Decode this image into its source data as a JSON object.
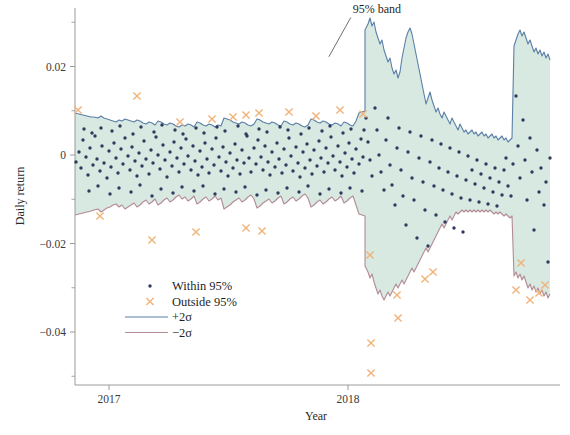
{
  "chart_data": {
    "type": "scatter",
    "title": "",
    "xlabel": "Year",
    "ylabel": "Daily return",
    "xlim": [
      2016.86,
      2018.78
    ],
    "ylim": [
      -0.0505,
      0.0345
    ],
    "grid": false,
    "x_ticks": [
      {
        "value": 2017,
        "label": "2017"
      },
      {
        "value": 2018,
        "label": "2018"
      }
    ],
    "y_ticks": [
      {
        "value": 0.02,
        "label": "0.02"
      },
      {
        "value": 0,
        "label": "0"
      },
      {
        "value": -0.02,
        "label": "−0.02"
      },
      {
        "value": -0.04,
        "label": "−0.04"
      }
    ],
    "y_minor_ticks": [
      0.03,
      0.01,
      -0.01,
      -0.03,
      -0.05
    ],
    "annotations": [
      {
        "text": "95% band",
        "text_x": 2018.02,
        "text_y": 0.0322,
        "leader_to_x": 2017.92,
        "leader_to_y": 0.0222
      }
    ],
    "legend": {
      "position": "lower-left-inside",
      "entries": [
        {
          "label": "Within 95%",
          "marker": "dot",
          "color": "#2e3b5e"
        },
        {
          "label": "Outside 95%",
          "marker": "cross",
          "color": "#f0b37a"
        },
        {
          "label": "+2σ",
          "marker": "line",
          "color": "#5a7fa8"
        },
        {
          "label": "−2σ",
          "marker": "line",
          "color": "#b38a96"
        }
      ]
    },
    "colors": {
      "band_fill": "#d7e9e1",
      "upper_line": "#5a7fa8",
      "lower_line": "#b38a96",
      "within_marker": "#2e3b5e",
      "outside_marker": "#f0b37a",
      "axis": "#9a9a9a",
      "text": "#1f1f1f"
    },
    "series": [
      {
        "name": "+2σ",
        "type": "line",
        "color": "#5a7fa8",
        "points_px": "75,113 79,114 83,115 87,116 91,117 94,117 98,118 101,116 104,118 107,119 110,120 113,121 116,122 119,120 122,121 125,119 128,120 131,121 134,122 137,120 140,121 143,123 146,124 149,122 152,123 155,125 158,121 161,122 164,124 167,125 170,123 173,124 176,126 179,127 182,125 185,126 188,124 191,125 194,127 197,122 200,123 203,125 206,126 209,124 212,125 215,127 218,125 221,126 224,118 227,119 230,120 233,122 236,123 239,124 242,122 245,123 248,125 251,126 254,124 257,119 260,120 263,122 266,123 269,124 272,122 275,123 278,125 281,126 284,121 287,122 290,124 293,125 296,123 299,124 302,126 305,127 308,125 311,119 314,120 317,122 320,123 323,121 326,122 329,124 332,125 335,123 338,124 341,126 344,122 347,123 350,125 353,126 356,121 359,113 362,112 365,111 365,30 368,24 370,18 372,26 374,22 376,32 378,38 380,44 382,40 384,50 386,56 388,62 390,58 392,68 394,74 396,70 398,78 400,72 402,58 404,48 406,38 408,32 410,28 412,34 414,44 416,54 418,64 420,74 422,84 424,94 426,104 428,98 430,92 432,100 434,106 436,112 438,108 440,114 442,118 444,112 446,116 448,120 450,124 452,118 454,122 456,126 458,130 460,124 462,128 464,132 466,130 468,134 470,132 472,130 474,134 476,132 478,136 480,134 482,132 484,136 486,134 488,138 490,136 492,134 494,138 496,136 498,140 500,138 502,136 504,140 506,138 508,142 510,140 512,138 514,46 516,40 518,34 520,30 522,36 524,32 526,38 528,44 530,40 532,46 534,52 536,48 538,54 540,50 542,56 544,52 546,58 548,54 550,60"
      },
      {
        "name": "−2σ",
        "type": "line",
        "color": "#b38a96",
        "points_px": "75,215 79,214 83,213 87,212 91,211 94,210 98,209 101,212 104,210 107,208 110,207 113,205 116,204 119,207 122,205 125,209 128,207 131,205 134,203 137,207 140,205 143,202 146,200 149,204 152,202 155,199 158,205 161,203 164,200 167,198 170,202 173,200 176,197 179,195 182,199 185,197 188,201 191,199 194,196 197,204 200,202 203,199 206,197 209,201 212,199 215,196 218,200 221,198 224,209 227,207 230,205 233,202 236,200 239,198 242,202 245,200 248,197 251,195 254,199 257,208 260,206 263,203 266,201 269,199 272,203 275,201 278,198 281,196 284,204 287,202 290,199 293,197 296,201 299,199 302,196 305,194 308,198 311,207 314,205 317,202 320,200 323,204 326,202 329,199 332,197 335,201 338,199 341,196 344,203 347,201 350,198 353,196 356,205 359,214 362,215 365,216 365,266 368,272 370,278 372,274 374,282 376,288 378,294 380,290 382,296 384,300 386,296 388,292 390,296 392,292 394,288 396,284 398,288 400,284 402,280 404,284 406,280 408,276 410,272 412,268 414,272 416,268 418,264 420,260 422,256 424,252 426,248 428,252 430,248 432,244 434,240 436,236 438,232 440,228 442,224 444,228 446,224 448,220 450,216 452,220 454,216 456,212 458,214 460,212 462,210 464,212 466,210 468,212 470,210 472,212 474,210 476,212 478,210 480,212 482,210 484,212 486,210 488,212 490,210 492,212 494,214 496,212 498,214 500,212 502,214 504,216 506,214 508,216 510,218 512,216 514,276 516,272 518,278 520,274 522,280 524,276 526,282 528,288 530,284 532,290 534,286 536,292 538,288 540,294 542,290 544,296 546,292 548,298 550,294"
      }
    ],
    "within_points_px": [
      [
        76,
        162
      ],
      [
        79,
        152
      ],
      [
        81,
        168
      ],
      [
        83,
        140
      ],
      [
        86,
        157
      ],
      [
        88,
        175
      ],
      [
        90,
        148
      ],
      [
        93,
        165
      ],
      [
        95,
        136
      ],
      [
        97,
        159
      ],
      [
        100,
        171
      ],
      [
        102,
        146
      ],
      [
        104,
        163
      ],
      [
        107,
        178
      ],
      [
        109,
        151
      ],
      [
        111,
        167
      ],
      [
        114,
        143
      ],
      [
        116,
        158
      ],
      [
        118,
        173
      ],
      [
        121,
        149
      ],
      [
        123,
        164
      ],
      [
        125,
        138
      ],
      [
        128,
        156
      ],
      [
        130,
        170
      ],
      [
        132,
        147
      ],
      [
        135,
        161
      ],
      [
        137,
        176
      ],
      [
        139,
        153
      ],
      [
        142,
        166
      ],
      [
        144,
        141
      ],
      [
        146,
        159
      ],
      [
        149,
        174
      ],
      [
        151,
        150
      ],
      [
        153,
        163
      ],
      [
        156,
        137
      ],
      [
        158,
        155
      ],
      [
        160,
        169
      ],
      [
        163,
        145
      ],
      [
        165,
        160
      ],
      [
        167,
        177
      ],
      [
        170,
        152
      ],
      [
        172,
        166
      ],
      [
        174,
        142
      ],
      [
        177,
        158
      ],
      [
        179,
        172
      ],
      [
        181,
        148
      ],
      [
        184,
        164
      ],
      [
        186,
        139
      ],
      [
        188,
        156
      ],
      [
        191,
        170
      ],
      [
        193,
        146
      ],
      [
        195,
        161
      ],
      [
        198,
        175
      ],
      [
        200,
        151
      ],
      [
        202,
        167
      ],
      [
        205,
        143
      ],
      [
        207,
        159
      ],
      [
        209,
        173
      ],
      [
        212,
        149
      ],
      [
        214,
        165
      ],
      [
        216,
        138
      ],
      [
        219,
        157
      ],
      [
        221,
        171
      ],
      [
        223,
        147
      ],
      [
        226,
        162
      ],
      [
        228,
        176
      ],
      [
        230,
        153
      ],
      [
        233,
        168
      ],
      [
        235,
        144
      ],
      [
        237,
        160
      ],
      [
        240,
        174
      ],
      [
        242,
        150
      ],
      [
        244,
        163
      ],
      [
        247,
        136
      ],
      [
        249,
        158
      ],
      [
        251,
        172
      ],
      [
        254,
        148
      ],
      [
        256,
        164
      ],
      [
        258,
        140
      ],
      [
        261,
        157
      ],
      [
        263,
        170
      ],
      [
        265,
        146
      ],
      [
        268,
        162
      ],
      [
        270,
        175
      ],
      [
        272,
        152
      ],
      [
        275,
        167
      ],
      [
        277,
        143
      ],
      [
        279,
        159
      ],
      [
        282,
        173
      ],
      [
        284,
        149
      ],
      [
        286,
        165
      ],
      [
        289,
        138
      ],
      [
        291,
        156
      ],
      [
        293,
        171
      ],
      [
        296,
        147
      ],
      [
        298,
        163
      ],
      [
        300,
        177
      ],
      [
        303,
        152
      ],
      [
        305,
        168
      ],
      [
        307,
        144
      ],
      [
        310,
        160
      ],
      [
        312,
        174
      ],
      [
        314,
        150
      ],
      [
        317,
        166
      ],
      [
        319,
        141
      ],
      [
        321,
        158
      ],
      [
        324,
        172
      ],
      [
        326,
        148
      ],
      [
        328,
        163
      ],
      [
        331,
        137
      ],
      [
        333,
        156
      ],
      [
        335,
        170
      ],
      [
        338,
        146
      ],
      [
        340,
        162
      ],
      [
        342,
        176
      ],
      [
        345,
        153
      ],
      [
        347,
        167
      ],
      [
        349,
        143
      ],
      [
        352,
        159
      ],
      [
        354,
        173
      ],
      [
        356,
        149
      ],
      [
        359,
        164
      ],
      [
        361,
        139
      ],
      [
        363,
        157
      ],
      [
        366,
        118
      ],
      [
        368,
        142
      ],
      [
        370,
        160
      ],
      [
        372,
        176
      ],
      [
        375,
        108
      ],
      [
        377,
        130
      ],
      [
        379,
        155
      ],
      [
        381,
        172
      ],
      [
        384,
        190
      ],
      [
        386,
        140
      ],
      [
        388,
        118
      ],
      [
        390,
        165
      ],
      [
        392,
        185
      ],
      [
        395,
        205
      ],
      [
        397,
        148
      ],
      [
        399,
        128
      ],
      [
        401,
        170
      ],
      [
        403,
        196
      ],
      [
        406,
        225
      ],
      [
        408,
        152
      ],
      [
        410,
        132
      ],
      [
        412,
        178
      ],
      [
        414,
        200
      ],
      [
        417,
        238
      ],
      [
        419,
        158
      ],
      [
        421,
        136
      ],
      [
        423,
        182
      ],
      [
        425,
        210
      ],
      [
        428,
        246
      ],
      [
        430,
        162
      ],
      [
        432,
        140
      ],
      [
        434,
        186
      ],
      [
        436,
        215
      ],
      [
        439,
        168
      ],
      [
        441,
        144
      ],
      [
        443,
        190
      ],
      [
        445,
        222
      ],
      [
        448,
        172
      ],
      [
        450,
        148
      ],
      [
        452,
        194
      ],
      [
        454,
        228
      ],
      [
        457,
        176
      ],
      [
        459,
        152
      ],
      [
        461,
        198
      ],
      [
        463,
        232
      ],
      [
        466,
        180
      ],
      [
        468,
        156
      ],
      [
        470,
        200
      ],
      [
        472,
        170
      ],
      [
        475,
        184
      ],
      [
        477,
        160
      ],
      [
        479,
        202
      ],
      [
        481,
        174
      ],
      [
        484,
        188
      ],
      [
        486,
        164
      ],
      [
        488,
        204
      ],
      [
        490,
        178
      ],
      [
        493,
        192
      ],
      [
        495,
        168
      ],
      [
        497,
        206
      ],
      [
        499,
        182
      ],
      [
        502,
        195
      ],
      [
        504,
        170
      ],
      [
        506,
        158
      ],
      [
        508,
        186
      ],
      [
        511,
        196
      ],
      [
        513,
        164
      ],
      [
        516,
        96
      ],
      [
        518,
        146
      ],
      [
        520,
        178
      ],
      [
        523,
        120
      ],
      [
        525,
        160
      ],
      [
        527,
        200
      ],
      [
        530,
        138
      ],
      [
        532,
        172
      ],
      [
        534,
        230
      ],
      [
        537,
        150
      ],
      [
        539,
        192
      ],
      [
        541,
        168
      ],
      [
        544,
        205
      ],
      [
        546,
        182
      ],
      [
        548,
        262
      ],
      [
        550,
        158
      ],
      [
        84,
        129
      ],
      [
        92,
        133
      ],
      [
        101,
        128
      ],
      [
        112,
        131
      ],
      [
        120,
        126
      ],
      [
        133,
        134
      ],
      [
        141,
        127
      ],
      [
        154,
        132
      ],
      [
        162,
        125
      ],
      [
        175,
        130
      ],
      [
        183,
        134
      ],
      [
        196,
        128
      ],
      [
        204,
        133
      ],
      [
        217,
        127
      ],
      [
        225,
        131
      ],
      [
        238,
        126
      ],
      [
        246,
        134
      ],
      [
        259,
        129
      ],
      [
        267,
        132
      ],
      [
        280,
        127
      ],
      [
        288,
        130
      ],
      [
        301,
        134
      ],
      [
        309,
        128
      ],
      [
        322,
        131
      ],
      [
        330,
        126
      ],
      [
        343,
        133
      ],
      [
        351,
        129
      ],
      [
        364,
        130
      ],
      [
        89,
        191
      ],
      [
        98,
        186
      ],
      [
        110,
        194
      ],
      [
        119,
        188
      ],
      [
        131,
        192
      ],
      [
        140,
        185
      ],
      [
        152,
        196
      ],
      [
        161,
        189
      ],
      [
        173,
        193
      ],
      [
        182,
        187
      ],
      [
        194,
        191
      ],
      [
        203,
        186
      ],
      [
        215,
        194
      ],
      [
        224,
        189
      ],
      [
        236,
        192
      ],
      [
        245,
        187
      ],
      [
        257,
        195
      ],
      [
        266,
        190
      ],
      [
        278,
        193
      ],
      [
        287,
        188
      ],
      [
        299,
        192
      ],
      [
        308,
        186
      ],
      [
        320,
        194
      ],
      [
        329,
        189
      ],
      [
        341,
        193
      ],
      [
        350,
        188
      ],
      [
        362,
        191
      ]
    ],
    "outside_points_px": [
      [
        78,
        110
      ],
      [
        137,
        96
      ],
      [
        180,
        122
      ],
      [
        212,
        119
      ],
      [
        233,
        117
      ],
      [
        246,
        115
      ],
      [
        259,
        113
      ],
      [
        289,
        112
      ],
      [
        316,
        116
      ],
      [
        340,
        110
      ],
      [
        363,
        114
      ],
      [
        100,
        216
      ],
      [
        152,
        240
      ],
      [
        196,
        232
      ],
      [
        246,
        228
      ],
      [
        262,
        231
      ],
      [
        370,
        255
      ],
      [
        397,
        295
      ],
      [
        398,
        318
      ],
      [
        371,
        373
      ],
      [
        371,
        343
      ],
      [
        425,
        279
      ],
      [
        433,
        272
      ],
      [
        521,
        263
      ],
      [
        530,
        300
      ],
      [
        539,
        293
      ],
      [
        545,
        285
      ],
      [
        516,
        290
      ]
    ]
  },
  "figure": {
    "background": "#ffffff"
  }
}
